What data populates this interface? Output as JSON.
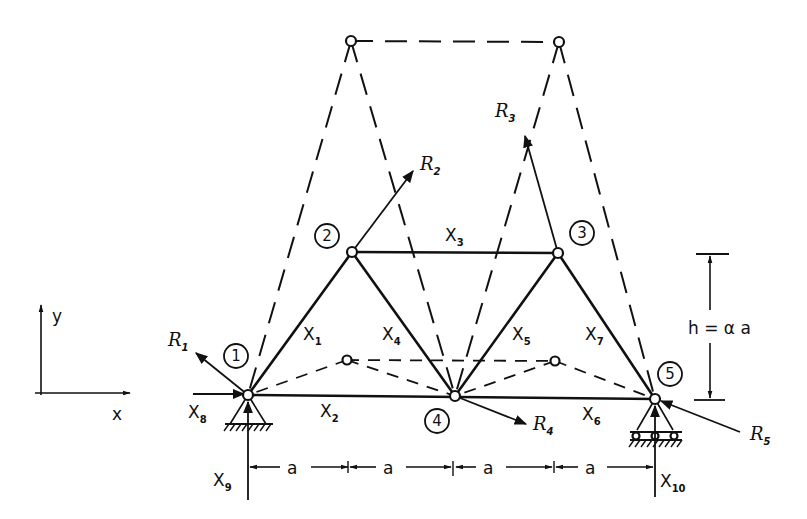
{
  "figure": {
    "type": "plane truss diagram with displaced (virtual) configuration",
    "axes": {
      "x_label": "x",
      "y_label": "y"
    },
    "nodes": [
      {
        "id": "1",
        "label": "1"
      },
      {
        "id": "2",
        "label": "2"
      },
      {
        "id": "3",
        "label": "3"
      },
      {
        "id": "4",
        "label": "4"
      },
      {
        "id": "5",
        "label": "5"
      }
    ],
    "members": [
      {
        "label": "X",
        "sub": "1",
        "from": "1",
        "to": "2"
      },
      {
        "label": "X",
        "sub": "2",
        "from": "1",
        "to": "4"
      },
      {
        "label": "X",
        "sub": "3",
        "from": "2",
        "to": "3"
      },
      {
        "label": "X",
        "sub": "4",
        "from": "2",
        "to": "4"
      },
      {
        "label": "X",
        "sub": "5",
        "from": "4",
        "to": "3"
      },
      {
        "label": "X",
        "sub": "6",
        "from": "4",
        "to": "5"
      },
      {
        "label": "X",
        "sub": "7",
        "from": "3",
        "to": "5"
      }
    ],
    "reactions": [
      {
        "label": "X",
        "sub": "8",
        "node": "1",
        "direction": "horizontal"
      },
      {
        "label": "X",
        "sub": "9",
        "node": "1",
        "direction": "vertical"
      },
      {
        "label": "X",
        "sub": "10",
        "node": "5",
        "direction": "vertical"
      }
    ],
    "loads": [
      {
        "label": "R",
        "sub": "1",
        "node": "1"
      },
      {
        "label": "R",
        "sub": "2",
        "node": "2"
      },
      {
        "label": "R",
        "sub": "3",
        "node": "3"
      },
      {
        "label": "R",
        "sub": "4",
        "node": "4"
      },
      {
        "label": "R",
        "sub": "5",
        "node": "5"
      }
    ],
    "dimensions": {
      "spans": [
        "a",
        "a",
        "a",
        "a"
      ],
      "height_label": "h = α a"
    },
    "supports": {
      "node_1": "pinned support",
      "node_5": "roller support"
    }
  }
}
